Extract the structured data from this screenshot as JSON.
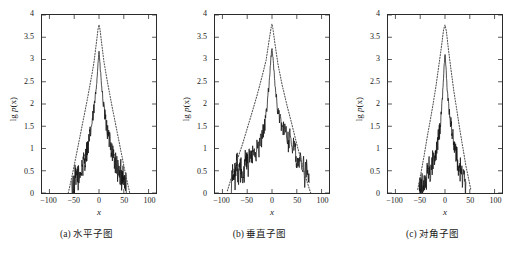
{
  "figure": {
    "background": "#ffffff",
    "axis_color": "#2b2b2b",
    "data_color": "#111111",
    "fit_color": "#555555"
  },
  "axes": {
    "ylabel": "lg p(x)",
    "ylabel_prefix": "lg ",
    "ylabel_italic": "p",
    "ylabel_suffix": "(x)",
    "xlabel": "x",
    "yticks": [
      "0",
      "0.5",
      "1",
      "1.5",
      "2",
      "2.5",
      "3",
      "3.5",
      "4"
    ],
    "ytick_values": [
      0,
      0.5,
      1,
      1.5,
      2,
      2.5,
      3,
      3.5,
      4
    ],
    "xticks": [
      "−100",
      "−50",
      "0",
      "50",
      "100"
    ],
    "xtick_values": [
      -100,
      -50,
      0,
      50,
      100
    ],
    "xlim": [
      -115,
      115
    ],
    "ylim": [
      0,
      4
    ]
  },
  "panels": [
    {
      "id": "a",
      "caption": "(a) 水平子图"
    },
    {
      "id": "b",
      "caption": "(b) 垂直子图"
    },
    {
      "id": "c",
      "caption": "(c) 对角子图"
    }
  ],
  "chart_data": [
    {
      "type": "line",
      "id": "a",
      "title": "(a) 水平子图",
      "xlabel": "x",
      "ylabel": "lg p(x)",
      "xlim": [
        -115,
        115
      ],
      "ylim": [
        0,
        4
      ],
      "grid": false,
      "legend": "none",
      "series": [
        {
          "name": "empirical",
          "style": "solid",
          "peak_x": 0,
          "peak_y": 3.2,
          "support": [
            -55,
            55
          ],
          "x": [
            -55,
            -52,
            -50,
            -48,
            -46,
            -44,
            -42,
            -40,
            -38,
            -36,
            -34,
            -32,
            -30,
            -28,
            -26,
            -24,
            -22,
            -20,
            -18,
            -16,
            -14,
            -12,
            -10,
            -8,
            -6,
            -4,
            -2,
            0,
            2,
            4,
            6,
            8,
            10,
            12,
            14,
            16,
            18,
            20,
            22,
            24,
            26,
            28,
            30,
            32,
            34,
            36,
            38,
            40,
            42,
            44,
            46,
            48,
            50,
            52,
            55
          ],
          "y": [
            0.05,
            0.3,
            0.12,
            0.4,
            0.2,
            0.48,
            0.35,
            0.3,
            0.55,
            0.42,
            0.65,
            0.58,
            0.8,
            0.72,
            0.9,
            0.98,
            1.05,
            1.18,
            1.3,
            1.45,
            1.58,
            1.72,
            1.9,
            2.08,
            2.32,
            2.6,
            2.9,
            3.2,
            2.88,
            2.58,
            2.3,
            2.08,
            1.88,
            1.72,
            1.58,
            1.45,
            1.32,
            1.18,
            1.3,
            1.05,
            0.95,
            0.88,
            0.8,
            0.72,
            0.65,
            0.58,
            0.5,
            0.42,
            0.35,
            0.52,
            0.28,
            0.45,
            0.2,
            0.38,
            0.05
          ]
        },
        {
          "name": "fit",
          "style": "dotted",
          "peak_x": 0,
          "peak_y": 3.78,
          "support": [
            -62,
            62
          ],
          "x": [
            -62,
            -55,
            -50,
            -45,
            -40,
            -35,
            -30,
            -25,
            -20,
            -15,
            -10,
            -5,
            -2,
            0,
            2,
            5,
            10,
            15,
            20,
            25,
            30,
            35,
            40,
            45,
            50,
            55,
            62
          ],
          "y": [
            0.0,
            0.35,
            0.62,
            0.9,
            1.18,
            1.46,
            1.74,
            2.02,
            2.32,
            2.62,
            2.95,
            3.4,
            3.68,
            3.78,
            3.68,
            3.4,
            2.95,
            2.62,
            2.32,
            2.02,
            1.74,
            1.46,
            1.18,
            0.9,
            0.62,
            0.35,
            0.0
          ]
        }
      ]
    },
    {
      "type": "line",
      "id": "b",
      "title": "(b) 垂直子图",
      "xlabel": "x",
      "ylabel": "lg p(x)",
      "xlim": [
        -115,
        115
      ],
      "ylim": [
        0,
        4
      ],
      "grid": false,
      "legend": "none",
      "series": [
        {
          "name": "empirical",
          "style": "solid",
          "peak_x": 0,
          "peak_y": 3.28,
          "support": [
            -82,
            75
          ],
          "x": [
            -82,
            -80,
            -78,
            -76,
            -74,
            -72,
            -70,
            -68,
            -66,
            -64,
            -62,
            -60,
            -58,
            -56,
            -54,
            -52,
            -50,
            -48,
            -45,
            -42,
            -40,
            -38,
            -35,
            -32,
            -30,
            -27,
            -24,
            -21,
            -18,
            -15,
            -12,
            -9,
            -6,
            -4,
            -2,
            0,
            2,
            4,
            6,
            9,
            12,
            15,
            18,
            21,
            24,
            27,
            30,
            33,
            36,
            39,
            42,
            45,
            48,
            50,
            52,
            55,
            58,
            60,
            63,
            66,
            69,
            72,
            75
          ],
          "y": [
            0.05,
            0.5,
            0.3,
            0.62,
            0.22,
            0.58,
            0.7,
            0.35,
            0.62,
            0.48,
            0.55,
            0.08,
            0.62,
            0.5,
            0.72,
            0.58,
            0.78,
            0.62,
            0.82,
            0.7,
            0.88,
            0.8,
            0.95,
            0.88,
            1.05,
            1.0,
            1.12,
            1.22,
            1.35,
            1.52,
            1.75,
            2.05,
            2.45,
            2.75,
            3.05,
            3.28,
            3.02,
            2.72,
            2.45,
            2.1,
            1.85,
            1.68,
            1.55,
            1.48,
            1.42,
            1.35,
            1.28,
            1.12,
            1.32,
            1.18,
            1.05,
            1.1,
            0.92,
            0.7,
            0.85,
            0.6,
            0.72,
            0.45,
            0.6,
            0.38,
            0.52,
            0.42,
            0.05
          ]
        },
        {
          "name": "fit",
          "style": "dotted",
          "peak_x": 0,
          "peak_y": 3.8,
          "support": [
            -90,
            78
          ],
          "x": [
            -90,
            -80,
            -70,
            -60,
            -50,
            -40,
            -30,
            -20,
            -12,
            -6,
            -2,
            0,
            2,
            6,
            12,
            20,
            30,
            40,
            50,
            60,
            70,
            78
          ],
          "y": [
            0.05,
            0.42,
            0.75,
            1.08,
            1.45,
            1.82,
            2.2,
            2.62,
            2.98,
            3.42,
            3.7,
            3.8,
            3.68,
            3.35,
            2.9,
            2.45,
            1.98,
            1.55,
            1.1,
            0.68,
            0.28,
            0.0
          ]
        }
      ]
    },
    {
      "type": "line",
      "id": "c",
      "title": "(c) 对角子图",
      "xlabel": "x",
      "ylabel": "lg p(x)",
      "xlim": [
        -115,
        115
      ],
      "ylim": [
        0,
        4
      ],
      "grid": false,
      "legend": "none",
      "series": [
        {
          "name": "empirical",
          "style": "solid",
          "peak_x": 0,
          "peak_y": 3.15,
          "support": [
            -52,
            42
          ],
          "x": [
            -52,
            -50,
            -48,
            -46,
            -44,
            -42,
            -40,
            -38,
            -36,
            -34,
            -32,
            -30,
            -28,
            -26,
            -24,
            -22,
            -20,
            -18,
            -16,
            -14,
            -12,
            -10,
            -8,
            -6,
            -4,
            -2,
            0,
            2,
            4,
            6,
            8,
            10,
            12,
            14,
            16,
            18,
            20,
            22,
            24,
            26,
            28,
            30,
            32,
            34,
            36,
            38,
            40,
            42
          ],
          "y": [
            0.28,
            0.05,
            0.22,
            0.1,
            0.3,
            0.18,
            0.38,
            0.25,
            0.45,
            0.35,
            0.55,
            0.48,
            0.68,
            0.6,
            0.78,
            0.72,
            0.9,
            0.95,
            1.05,
            1.18,
            1.32,
            1.48,
            1.72,
            2.0,
            2.38,
            2.8,
            3.15,
            2.82,
            2.45,
            2.15,
            1.92,
            1.7,
            1.52,
            1.38,
            1.25,
            1.12,
            1.0,
            0.9,
            0.8,
            0.7,
            0.62,
            0.55,
            0.48,
            0.42,
            0.3,
            0.38,
            0.18,
            0.05
          ]
        },
        {
          "name": "fit",
          "style": "dotted",
          "peak_x": 0,
          "peak_y": 3.78,
          "support": [
            -55,
            52
          ],
          "x": [
            -55,
            -48,
            -42,
            -36,
            -30,
            -24,
            -18,
            -12,
            -7,
            -3,
            0,
            3,
            7,
            12,
            18,
            24,
            30,
            36,
            42,
            48,
            52
          ],
          "y": [
            0.08,
            0.48,
            0.85,
            1.25,
            1.62,
            2.0,
            2.42,
            2.9,
            3.3,
            3.66,
            3.78,
            3.62,
            3.22,
            2.78,
            2.28,
            1.85,
            1.42,
            1.02,
            0.62,
            0.3,
            0.08
          ]
        }
      ]
    }
  ]
}
